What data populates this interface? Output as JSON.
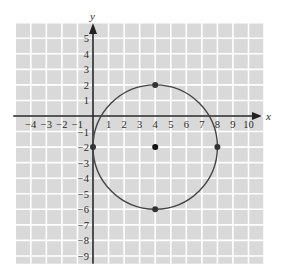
{
  "chart_data": {
    "type": "scatter",
    "title": "",
    "xlabel": "x",
    "ylabel": "y",
    "xlim": [
      -5,
      11
    ],
    "ylim": [
      -9.5,
      6
    ],
    "grid": true,
    "x_ticks": [
      -4,
      -3,
      -2,
      -1,
      1,
      2,
      3,
      4,
      5,
      6,
      7,
      8,
      9,
      10
    ],
    "y_ticks": [
      5,
      4,
      3,
      2,
      1,
      -1,
      -2,
      -3,
      -4,
      -5,
      -6,
      -7,
      -8,
      -9
    ],
    "circle": {
      "center": [
        4,
        -2
      ],
      "radius": 4
    },
    "points": [
      {
        "x": 4,
        "y": 2,
        "role": "top of circle"
      },
      {
        "x": 8,
        "y": -2,
        "role": "right of circle"
      },
      {
        "x": 4,
        "y": -6,
        "role": "bottom of circle"
      },
      {
        "x": 0,
        "y": -2,
        "role": "left of circle"
      },
      {
        "x": 4,
        "y": -2,
        "role": "center"
      }
    ],
    "legend": null
  },
  "colors": {
    "grid_bg": "#d9d9d9",
    "grid_line": "#ffffff",
    "axis": "#222222",
    "curve": "#444444",
    "point": "#333333",
    "center": "#111111"
  }
}
